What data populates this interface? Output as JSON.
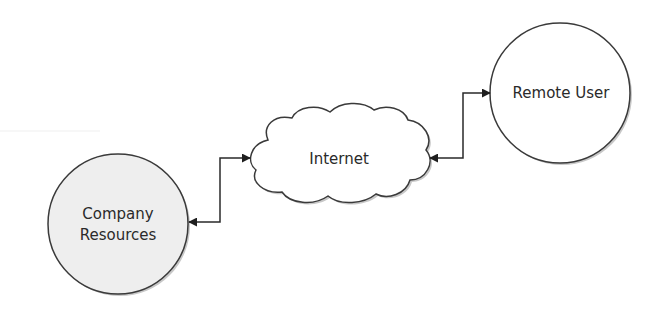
{
  "diagram": {
    "title": "",
    "colors": {
      "stroke": "#3a3a3a",
      "company_fill": "#eeeeee",
      "remote_fill": "#ffffff",
      "cloud_fill": "#ffffff",
      "shadow": "#c8c8c8",
      "text": "#2a2a2a"
    },
    "nodes": {
      "company": {
        "shape": "circle",
        "label_line1": "Company",
        "label_line2": "Resources"
      },
      "internet": {
        "shape": "cloud",
        "label": "Internet"
      },
      "remote": {
        "shape": "circle",
        "label": "Remote User"
      }
    },
    "edges": [
      {
        "from": "company",
        "to": "internet",
        "direction": "bidirectional"
      },
      {
        "from": "internet",
        "to": "remote",
        "direction": "bidirectional"
      }
    ]
  }
}
